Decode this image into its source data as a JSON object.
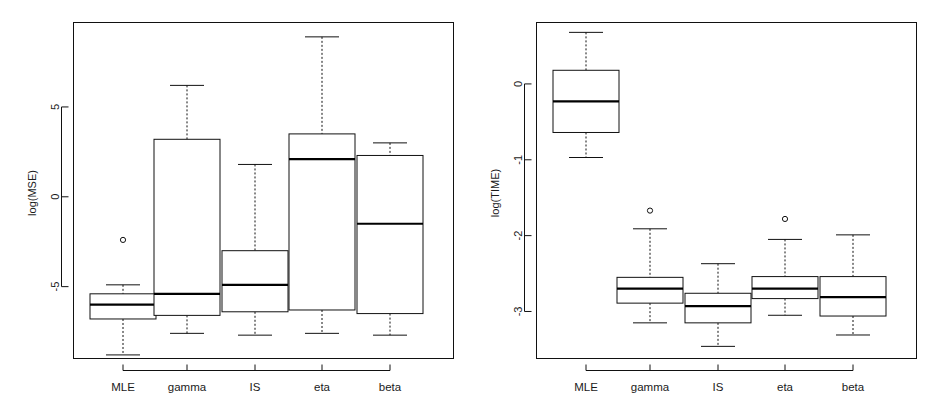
{
  "figure": {
    "kind": "two-panel-boxplot-figure",
    "background": "#ffffff",
    "foreground": "#111111",
    "panel_count": 2
  },
  "chart_data": [
    {
      "type": "box",
      "panel": "left",
      "title": "",
      "subtitle": "",
      "xlabel": "",
      "ylabel": "log(MSE)",
      "categories": [
        "MLE",
        "gamma",
        "IS",
        "eta",
        "beta"
      ],
      "ytick_labels": [
        "5",
        "0",
        "-5"
      ],
      "ytick_values": [
        5,
        0,
        -5
      ],
      "ylim": [
        -9.0,
        9.7
      ],
      "grid": false,
      "legend": null,
      "boxes": [
        {
          "name": "MLE",
          "whisker_low": -8.8,
          "q1": -6.8,
          "median": -6.0,
          "q3": -5.4,
          "whisker_high": -4.9,
          "outliers": [
            -2.4
          ]
        },
        {
          "name": "gamma",
          "whisker_low": -7.6,
          "q1": -6.6,
          "median": -5.4,
          "q3": 3.2,
          "whisker_high": 6.2,
          "outliers": []
        },
        {
          "name": "IS",
          "whisker_low": -7.7,
          "q1": -6.4,
          "median": -4.9,
          "q3": -3.0,
          "whisker_high": 1.8,
          "outliers": []
        },
        {
          "name": "eta",
          "whisker_low": -7.6,
          "q1": -6.3,
          "median": 2.1,
          "q3": 3.5,
          "whisker_high": 8.9,
          "outliers": []
        },
        {
          "name": "beta",
          "whisker_low": -7.7,
          "q1": -6.5,
          "median": -1.5,
          "q3": 2.3,
          "whisker_high": 3.0,
          "outliers": []
        }
      ]
    },
    {
      "type": "box",
      "panel": "right",
      "title": "",
      "subtitle": "",
      "xlabel": "",
      "ylabel": "log(TIME)",
      "categories": [
        "MLE",
        "gamma",
        "IS",
        "eta",
        "beta"
      ],
      "ytick_labels": [
        "0",
        "-1",
        "-2",
        "-3"
      ],
      "ytick_values": [
        0,
        -1,
        -2,
        -3
      ],
      "ylim": [
        -3.62,
        0.81
      ],
      "grid": false,
      "legend": null,
      "boxes": [
        {
          "name": "MLE",
          "whisker_low": -0.97,
          "q1": -0.64,
          "median": -0.23,
          "q3": 0.18,
          "whisker_high": 0.68,
          "outliers": []
        },
        {
          "name": "gamma",
          "whisker_low": -3.15,
          "q1": -2.89,
          "median": -2.7,
          "q3": -2.55,
          "whisker_high": -1.91,
          "outliers": [
            -1.67
          ]
        },
        {
          "name": "IS",
          "whisker_low": -3.46,
          "q1": -3.15,
          "median": -2.93,
          "q3": -2.76,
          "whisker_high": -2.37,
          "outliers": []
        },
        {
          "name": "eta",
          "whisker_low": -3.05,
          "q1": -2.83,
          "median": -2.7,
          "q3": -2.54,
          "whisker_high": -2.05,
          "outliers": [
            -1.78
          ]
        },
        {
          "name": "beta",
          "whisker_low": -3.31,
          "q1": -3.06,
          "median": -2.81,
          "q3": -2.54,
          "whisker_high": -1.99,
          "outliers": []
        }
      ]
    }
  ]
}
